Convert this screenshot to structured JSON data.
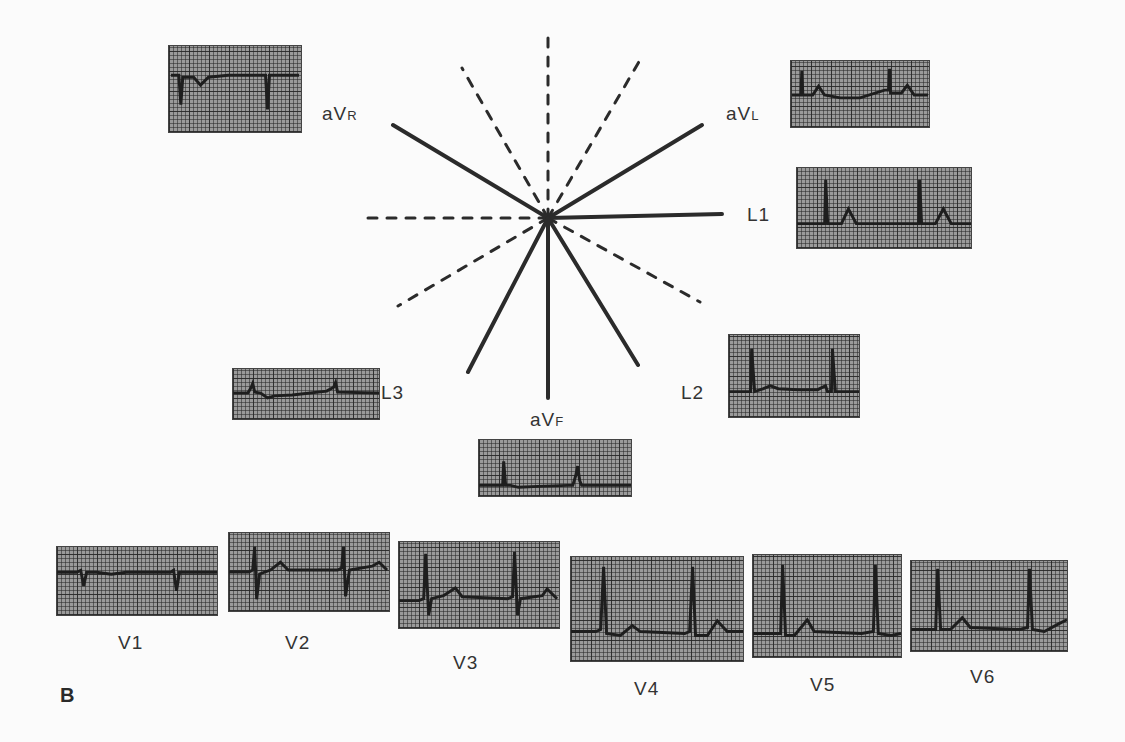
{
  "figure": {
    "panel_label": "B"
  },
  "limb_leads": [
    {
      "id": "aVR",
      "main": "aV",
      "sub": "R"
    },
    {
      "id": "aVL",
      "main": "aV",
      "sub": "L"
    },
    {
      "id": "L1",
      "main": "L1",
      "sub": ""
    },
    {
      "id": "L2",
      "main": "L2",
      "sub": ""
    },
    {
      "id": "L3",
      "main": "L3",
      "sub": ""
    },
    {
      "id": "aVF",
      "main": "aV",
      "sub": "F"
    }
  ],
  "precordial_leads": [
    {
      "id": "V1",
      "label": "V1"
    },
    {
      "id": "V2",
      "label": "V2"
    },
    {
      "id": "V3",
      "label": "V3"
    },
    {
      "id": "V4",
      "label": "V4"
    },
    {
      "id": "V5",
      "label": "V5"
    },
    {
      "id": "V6",
      "label": "V6"
    }
  ],
  "colors": {
    "grid_paper": "#9a9a9a",
    "trace": "#1e1e1e",
    "axis": "#2b2b2b",
    "background": "#fbfbfb"
  }
}
